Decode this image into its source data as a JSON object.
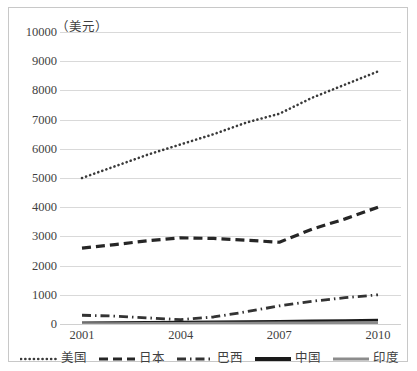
{
  "chart_data": {
    "type": "line",
    "title": "",
    "subtitle": "",
    "unit_label": "（美元）",
    "xlabel": "",
    "ylabel": "",
    "xlim": [
      2001,
      2010
    ],
    "ylim": [
      0,
      10000
    ],
    "y_ticks": [
      10000,
      9000,
      8000,
      7000,
      6000,
      5000,
      4000,
      3000,
      2000,
      1000,
      0
    ],
    "x_ticks": [
      2001,
      2004,
      2007,
      2010
    ],
    "x": [
      2001,
      2002,
      2003,
      2004,
      2005,
      2006,
      2007,
      2008,
      2009,
      2010
    ],
    "grid": true,
    "legend_position": "bottom",
    "series": [
      {
        "name": "美国",
        "style": "dotted",
        "color": "#3a3a3a",
        "values": [
          5000,
          5400,
          5800,
          6150,
          6500,
          6900,
          7200,
          7750,
          8200,
          8650
        ]
      },
      {
        "name": "日本",
        "style": "dashed",
        "color": "#262626",
        "values": [
          2600,
          2720,
          2850,
          2950,
          2930,
          2870,
          2800,
          3250,
          3600,
          4000
        ]
      },
      {
        "name": "巴西",
        "style": "dash-dot",
        "color": "#333333",
        "values": [
          300,
          270,
          210,
          150,
          240,
          420,
          620,
          780,
          900,
          1000
        ]
      },
      {
        "name": "中国",
        "style": "solid-thick",
        "color": "#1a1a1a",
        "values": [
          20,
          25,
          30,
          40,
          50,
          60,
          70,
          85,
          95,
          110
        ]
      },
      {
        "name": "印度",
        "style": "solid-gray",
        "color": "#8c8c8c",
        "values": [
          10,
          12,
          15,
          18,
          22,
          26,
          30,
          36,
          42,
          50
        ]
      }
    ]
  }
}
